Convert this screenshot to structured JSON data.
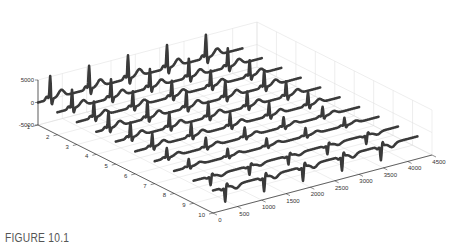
{
  "figure": {
    "caption": "FIGURE 10.1"
  },
  "chart_data": {
    "type": "line",
    "subtype": "3d-waterfall",
    "title": "",
    "xlabel": "",
    "ylabel": "",
    "zlabel": "",
    "x_range": [
      0,
      4500
    ],
    "y_range": [
      1,
      10
    ],
    "z_range": [
      -5000,
      5000
    ],
    "x_ticks": [
      "0",
      "500",
      "1000",
      "1500",
      "2000",
      "2500",
      "3000",
      "3500",
      "4000",
      "4500"
    ],
    "y_ticks": [
      "1",
      "2",
      "3",
      "4",
      "5",
      "6",
      "7",
      "8",
      "9",
      "10"
    ],
    "z_ticks": [
      "-5000",
      "0",
      "5000"
    ],
    "grid": true,
    "line_color": "#3a3a3a",
    "grid_color": "#dddddd",
    "series": [
      {
        "name": "1",
        "polarity": 1,
        "peak": 5200,
        "beats": [
          250,
          1050,
          1850,
          2650,
          3450
        ]
      },
      {
        "name": "2",
        "polarity": 1,
        "peak": 4200,
        "beats": [
          300,
          1100,
          1900,
          2700,
          3500
        ]
      },
      {
        "name": "3",
        "polarity": 1,
        "peak": 3600,
        "beats": [
          350,
          1150,
          1950,
          2750,
          3550
        ]
      },
      {
        "name": "4",
        "polarity": 1,
        "peak": 3800,
        "beats": [
          250,
          1050,
          1850,
          2650,
          3450
        ]
      },
      {
        "name": "5",
        "polarity": 1,
        "peak": 3400,
        "beats": [
          300,
          1100,
          1900,
          2700,
          3500
        ]
      },
      {
        "name": "6",
        "polarity": 1,
        "peak": 3000,
        "beats": [
          350,
          1150,
          1950,
          2750,
          3550
        ]
      },
      {
        "name": "7",
        "polarity": 1,
        "peak": 2200,
        "beats": [
          250,
          1050,
          1850,
          2650,
          3450
        ]
      },
      {
        "name": "8",
        "polarity": 1,
        "peak": 1800,
        "beats": [
          300,
          1100,
          1900,
          2700,
          3500
        ]
      },
      {
        "name": "9",
        "polarity": -1,
        "peak": 2000,
        "beats": [
          350,
          1150,
          1950,
          2750,
          3550
        ]
      },
      {
        "name": "10",
        "polarity": -1,
        "peak": 3200,
        "beats": [
          250,
          1050,
          1850,
          2650,
          3450
        ]
      }
    ]
  }
}
